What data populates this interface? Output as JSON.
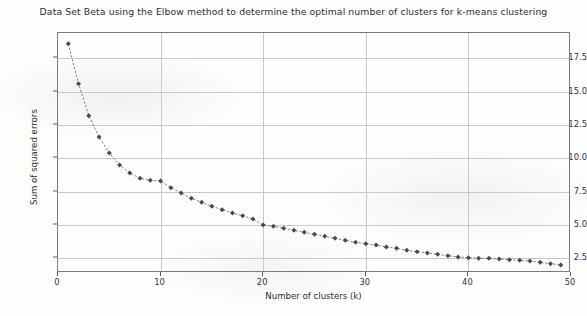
{
  "chart_data": {
    "type": "line",
    "title": "Data Set Beta using the Elbow method to determine the optimal number of clusters for k-means clustering",
    "xlabel": "Number of clusters (k)",
    "ylabel": "Sum of squared errors",
    "xlim": [
      0,
      50
    ],
    "ylim": [
      1.4,
      19.4
    ],
    "xticks": [
      0,
      10,
      20,
      30,
      40,
      50
    ],
    "xtick_labels": [
      "0",
      "10",
      "20",
      "30",
      "40",
      "50"
    ],
    "yticks": [
      2.5,
      5.0,
      7.5,
      10.0,
      12.5,
      15.0,
      17.5
    ],
    "ytick_labels": [
      "2.5",
      "5.0",
      "7.5",
      "10.0",
      "12.5",
      "15.0",
      "17.5"
    ],
    "grid": true,
    "legend": null,
    "marker": "diamond",
    "marker_color": "#4a4a4a",
    "line_style": "dashed",
    "line_color": "#6e6e6e",
    "series": [
      {
        "name": "Sum of squared errors",
        "x": [
          1,
          2,
          3,
          4,
          5,
          6,
          7,
          8,
          9,
          10,
          11,
          12,
          13,
          14,
          15,
          16,
          17,
          18,
          19,
          20,
          21,
          22,
          23,
          24,
          25,
          26,
          27,
          28,
          29,
          30,
          31,
          32,
          33,
          34,
          35,
          36,
          37,
          38,
          39,
          40,
          41,
          42,
          43,
          44,
          45,
          46,
          47,
          48,
          49
        ],
        "values": [
          18.6,
          15.6,
          13.2,
          11.6,
          10.4,
          9.5,
          8.9,
          8.5,
          8.35,
          8.3,
          7.8,
          7.4,
          7.0,
          6.7,
          6.4,
          6.15,
          5.9,
          5.7,
          5.45,
          5.0,
          4.9,
          4.75,
          4.6,
          4.45,
          4.3,
          4.15,
          4.0,
          3.85,
          3.7,
          3.6,
          3.5,
          3.35,
          3.25,
          3.1,
          3.0,
          2.9,
          2.8,
          2.7,
          2.6,
          2.55,
          2.5,
          2.5,
          2.45,
          2.4,
          2.35,
          2.3,
          2.2,
          2.1,
          2.0
        ]
      }
    ]
  },
  "figure": {
    "background_color": "#fdfdfc",
    "axes_edge_color": "#7b7b7b",
    "grid_color": "#c9c9c9",
    "tick_color": "#5d5d5d",
    "text_color": "#2f2f2f"
  }
}
